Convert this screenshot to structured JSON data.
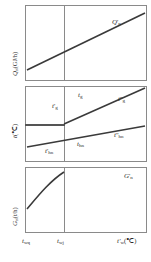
{
  "figure": {
    "type": "engineering-characteristic-diagram",
    "panel_count": 3
  },
  "panels": [
    {
      "id": "heat-load",
      "ylabel": "Q",
      "ylabel_sub": "n",
      "ylabel_unit": "(GJ/h)",
      "curve_label": "Q",
      "curve_label_sub": "n",
      "curve_label_prime": "'",
      "curve_kind": "line",
      "trend": "increasing-linear"
    },
    {
      "id": "temperature",
      "ylabel": "t",
      "ylabel_unit": "(℃)",
      "curve_kind": "piecewise",
      "labels": [
        {
          "name": "t-g-prime",
          "base": "t",
          "sub": "g",
          "prime": "'"
        },
        {
          "name": "t-g",
          "base": "t",
          "sub": "g",
          "prime": ""
        },
        {
          "name": "t-g-dprime",
          "base": "t",
          "sub": "g",
          "prime": "''"
        },
        {
          "name": "t-hn-prime",
          "base": "t",
          "sub": "hn",
          "prime": "'"
        },
        {
          "name": "t-hn",
          "base": "t",
          "sub": "hn",
          "prime": ""
        },
        {
          "name": "t-hn-dprime",
          "base": "t",
          "sub": "hn",
          "prime": "''"
        }
      ]
    },
    {
      "id": "flow-rate",
      "ylabel": "G",
      "ylabel_sub": "n",
      "ylabel_unit": "(t/h)",
      "curve_label": "G",
      "curve_label_sub": "n",
      "curve_label_prime": "'",
      "curve_kind": "rising-then-flat"
    }
  ],
  "xaxis": {
    "ticks": [
      {
        "name": "t-wq",
        "base": "t",
        "sub": "wq"
      },
      {
        "name": "t-wj",
        "base": "t",
        "sub": "wj"
      },
      {
        "name": "t-w-prime",
        "base": "t",
        "sub": "w",
        "prime": "'"
      }
    ],
    "unit": "(℃)"
  },
  "colors": {
    "axis": "#8a8a8a",
    "curve": "#3a3a3a",
    "text": "#2b2b2b",
    "background": "#ffffff"
  }
}
